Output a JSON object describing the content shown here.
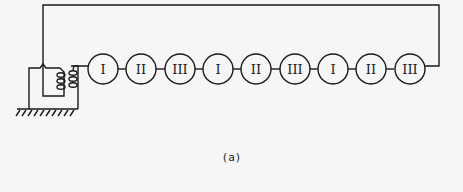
{
  "figure": {
    "caption": "(a)",
    "nodes": [
      {
        "label": "I"
      },
      {
        "label": "II"
      },
      {
        "label": "III"
      },
      {
        "label": "I"
      },
      {
        "label": "II"
      },
      {
        "label": "III"
      },
      {
        "label": "I"
      },
      {
        "label": "II"
      },
      {
        "label": "III"
      }
    ],
    "source": "transformer",
    "ground": "earth-ground"
  }
}
